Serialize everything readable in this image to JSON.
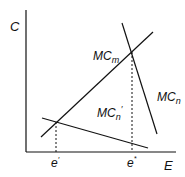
{
  "diagram": {
    "axes": {
      "y_label": "C",
      "x_label": "E"
    },
    "curves": [
      {
        "id": "MCm",
        "label_main": "MC",
        "label_sub": "m"
      },
      {
        "id": "MCn",
        "label_main": "MC",
        "label_sub": "n"
      },
      {
        "id": "MCn_prime",
        "label_main": "MC",
        "label_sub": "n",
        "label_prime": "′"
      }
    ],
    "ticks": [
      {
        "main": "e",
        "mark": "′"
      },
      {
        "main": "e",
        "mark": "*"
      }
    ],
    "colors": {
      "line": "#111111",
      "background": "#ffffff"
    }
  }
}
